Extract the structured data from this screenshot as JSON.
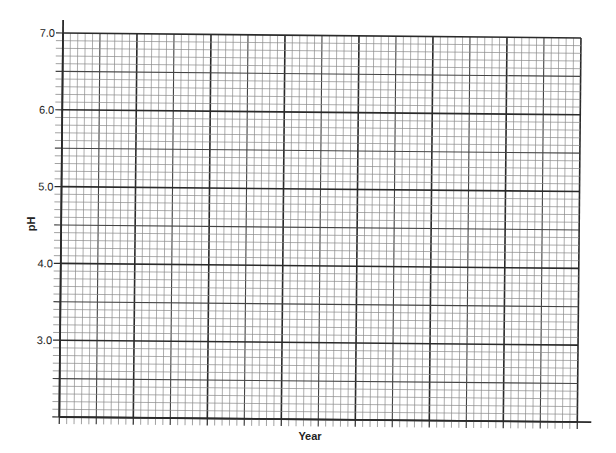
{
  "chart_data": {
    "type": "line",
    "title": "",
    "xlabel": "Year",
    "ylabel": "pH",
    "ylim": [
      2.0,
      7.0
    ],
    "yticks": [
      7.0,
      6.0,
      5.0,
      4.0,
      3.0
    ],
    "ytick_labels": [
      "7.0",
      "6.0",
      "5.0",
      "4.0",
      "3.0"
    ],
    "xtick_labels": [],
    "series": [],
    "grid": true,
    "grid_style": "graph paper: heavy lines every 1.0 pH, medium lines every 0.5, 10 minor divisions per major",
    "x_major_divisions": 7,
    "y_major_divisions": 5,
    "minor_per_major": 10,
    "legend": null,
    "note": "Blank graph paper template; no data plotted"
  },
  "axes": {
    "x_title": "Year",
    "y_title": "pH",
    "y_tick_labels": [
      "7.0",
      "6.0",
      "5.0",
      "4.0",
      "3.0"
    ]
  },
  "colors": {
    "background": "#ffffff",
    "grid_minor": "#8a8a8a",
    "grid_major": "#2a2a2a",
    "text": "#222222"
  }
}
